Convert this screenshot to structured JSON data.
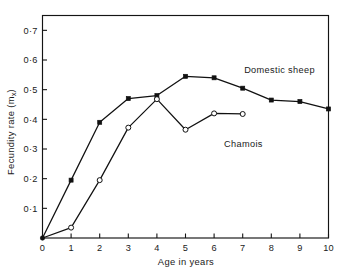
{
  "chart_data": {
    "type": "line",
    "title": "",
    "xlabel": "Age in years",
    "ylabel": "Fecundity rate (m",
    "ylabel_subscript": "x",
    "ylabel_suffix": ")",
    "xlim": [
      0,
      10
    ],
    "ylim": [
      0,
      0.75
    ],
    "grid": false,
    "legend_position": "inline-annotation",
    "x_ticks": [
      "0",
      "1",
      "2",
      "3",
      "4",
      "5",
      "6",
      "7",
      "8",
      "9",
      "10"
    ],
    "x_tick_values": [
      0,
      1,
      2,
      3,
      4,
      5,
      6,
      7,
      8,
      9,
      10
    ],
    "y_ticks": [
      "0·1",
      "0·2",
      "0·3",
      "0·4",
      "0·5",
      "0·6",
      "0·7"
    ],
    "y_tick_values": [
      0.1,
      0.2,
      0.3,
      0.4,
      0.5,
      0.6,
      0.7
    ],
    "series": [
      {
        "name": "Domestic sheep",
        "marker": "filled-square",
        "color": "#111111",
        "x": [
          0,
          1,
          2,
          3,
          4,
          5,
          6,
          7,
          8,
          9,
          10
        ],
        "values": [
          0.0,
          0.195,
          0.39,
          0.47,
          0.48,
          0.545,
          0.54,
          0.505,
          0.465,
          0.46,
          0.435
        ],
        "label_x": 7.05,
        "label_y": 0.545
      },
      {
        "name": "Chamois",
        "marker": "open-circle",
        "color": "#111111",
        "x": [
          0,
          1,
          2,
          3,
          4,
          5,
          6,
          7
        ],
        "values": [
          0.0,
          0.035,
          0.195,
          0.372,
          0.468,
          0.365,
          0.42,
          0.418
        ],
        "label_x": 6.35,
        "label_y": 0.365
      }
    ]
  },
  "figure": {
    "background_color": "#ffffff",
    "axis_color": "#141414"
  }
}
